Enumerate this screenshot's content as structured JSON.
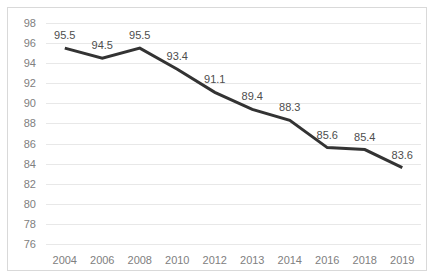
{
  "chart_data": {
    "type": "line",
    "title": "",
    "subtitle": "",
    "xlabel": "",
    "ylabel": "",
    "categories": [
      "2004",
      "2006",
      "2008",
      "2010",
      "2012",
      "2013",
      "2014",
      "2016",
      "2018",
      "2019"
    ],
    "values": [
      95.5,
      94.5,
      95.5,
      93.4,
      91.1,
      89.4,
      88.3,
      85.6,
      85.4,
      83.6
    ],
    "data_labels": [
      "95.5",
      "94.5",
      "95.5",
      "93.4",
      "91.1",
      "89.4",
      "88.3",
      "85.6",
      "85.4",
      "83.6"
    ],
    "data_label_position": "above",
    "ylim": [
      76,
      98
    ],
    "ytick_values": [
      98,
      96,
      94,
      92,
      90,
      88,
      86,
      84,
      82,
      80,
      78,
      76
    ],
    "ytick_labels": [
      "98",
      "96",
      "94",
      "92",
      "90",
      "88",
      "86",
      "84",
      "82",
      "80",
      "78",
      "76"
    ],
    "grid": {
      "horizontal": true,
      "vertical": false,
      "color": "#E8E8E8"
    },
    "legend": {
      "visible": false,
      "position": "none",
      "entries": []
    },
    "series": [
      {
        "name": "",
        "color": "#333333",
        "line_width": 3,
        "markers": false,
        "values": [
          95.5,
          94.5,
          95.5,
          93.4,
          91.1,
          89.4,
          88.3,
          85.6,
          85.4,
          83.6
        ]
      }
    ],
    "colors": {
      "line": "#333333",
      "grid": "#E8E8E8",
      "axis_text": "#808080",
      "label_text": "#4D4D4D",
      "border": "#D9D9D9",
      "background": "#FFFFFF"
    }
  }
}
